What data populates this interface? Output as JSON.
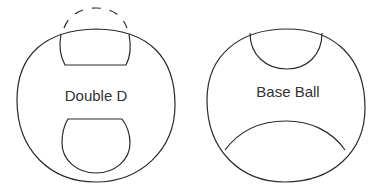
{
  "figures": [
    {
      "id": "double-d",
      "label": "Double D"
    },
    {
      "id": "base-ball",
      "label": "Base Ball"
    }
  ]
}
